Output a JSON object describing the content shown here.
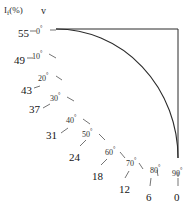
{
  "figure": {
    "value_axis_header": "I",
    "value_axis_header_sub": "f",
    "value_axis_header_unit": "(%)",
    "angle_axis_header": "v",
    "background_color": "#ffffff",
    "line_color": "#2b2b2b"
  },
  "chart_data": {
    "type": "line",
    "title": "",
    "subtitle": "",
    "xlabel": "",
    "ylabel": "",
    "grid": false,
    "legend": null,
    "axis_note": "Quarter-ellipse nomogram: each point on the curve pairs a value on the I_f(%) scale with an angle v in degrees.",
    "curve_shape": "quarter-ellipse",
    "curve_start": [
      56,
      29
    ],
    "curve_end": [
      178,
      158
    ],
    "frame_rect": [
      56,
      29,
      178,
      158
    ],
    "categories": [
      "0",
      "10",
      "20",
      "30",
      "40",
      "50",
      "60",
      "70",
      "80",
      "90"
    ],
    "series": [
      {
        "name": "I_f(%)",
        "values": [
          55,
          49,
          43,
          37,
          31,
          24,
          18,
          12,
          6,
          0
        ]
      }
    ],
    "angle_unit": "degrees",
    "points": [
      {
        "value": "55",
        "angle": "0",
        "value_x": 18,
        "value_y": 28,
        "angle_x": 36,
        "angle_y": 28,
        "tick_x1": 30,
        "tick_y1": 31,
        "tick_x2": 36,
        "tick_y2": 31,
        "tick2_x1": 50,
        "tick2_y1": 30,
        "tick2_x2": 56,
        "tick2_y2": 30
      },
      {
        "value": "49",
        "angle": "10",
        "value_x": 14,
        "value_y": 55,
        "angle_x": 32,
        "angle_y": 53,
        "tick_x1": 27,
        "tick_y1": 58,
        "tick_x2": 33,
        "tick_y2": 58,
        "tick2_x1": 49,
        "tick2_y1": 54,
        "tick2_x2": 56,
        "tick2_y2": 58
      },
      {
        "value": "43",
        "angle": "20",
        "value_x": 21,
        "value_y": 85,
        "angle_x": 38,
        "angle_y": 75,
        "tick_x1": 34,
        "tick_y1": 88,
        "tick_x2": 40,
        "tick_y2": 86,
        "tick2_x1": 56,
        "tick2_y1": 76,
        "tick2_x2": 62,
        "tick2_y2": 80
      },
      {
        "value": "37",
        "angle": "30",
        "value_x": 29,
        "value_y": 104,
        "angle_x": 50,
        "angle_y": 95,
        "tick_x1": 43,
        "tick_y1": 108,
        "tick_x2": 50,
        "tick_y2": 104,
        "tick2_x1": 67,
        "tick2_y1": 97,
        "tick2_x2": 74,
        "tick2_y2": 101
      },
      {
        "value": "31",
        "angle": "40",
        "value_x": 46,
        "value_y": 130,
        "angle_x": 66,
        "angle_y": 117,
        "tick_x1": 61,
        "tick_y1": 133,
        "tick_x2": 68,
        "tick_y2": 128,
        "tick2_x1": 83,
        "tick2_y1": 119,
        "tick2_x2": 90,
        "tick2_y2": 124
      },
      {
        "value": "24",
        "angle": "50",
        "value_x": 69,
        "value_y": 152,
        "angle_x": 82,
        "angle_y": 131,
        "tick_x1": 80,
        "tick_y1": 146,
        "tick_x2": 86,
        "tick_y2": 140,
        "tick2_x1": 99,
        "tick2_y1": 134,
        "tick2_x2": 105,
        "tick2_y2": 140
      },
      {
        "value": "18",
        "angle": "60",
        "value_x": 92,
        "value_y": 171,
        "angle_x": 105,
        "angle_y": 149,
        "tick_x1": 101,
        "tick_y1": 165,
        "tick_x2": 107,
        "tick_y2": 159,
        "tick2_x1": 120,
        "tick2_y1": 152,
        "tick2_x2": 125,
        "tick2_y2": 158
      },
      {
        "value": "12",
        "angle": "70",
        "value_x": 119,
        "value_y": 184,
        "angle_x": 126,
        "angle_y": 160,
        "tick_x1": 125,
        "tick_y1": 178,
        "tick_x2": 129,
        "tick_y2": 171,
        "tick2_x1": 139,
        "tick2_y1": 163,
        "tick2_x2": 143,
        "tick2_y2": 169
      },
      {
        "value": "6",
        "angle": "80",
        "value_x": 146,
        "value_y": 192,
        "angle_x": 150,
        "angle_y": 167,
        "tick_x1": 150,
        "tick_y1": 186,
        "tick_x2": 151,
        "tick_y2": 178,
        "tick2_x1": 157,
        "tick2_y1": 170,
        "tick2_x2": 158,
        "tick2_y2": 176
      },
      {
        "value": "0",
        "angle": "90",
        "value_x": 174,
        "value_y": 192,
        "angle_x": 172,
        "angle_y": 170,
        "tick_x1": 178,
        "tick_y1": 186,
        "tick_x2": 178,
        "tick_y2": 178,
        "tick2_x1": 178,
        "tick2_y1": 172,
        "tick2_x2": 178,
        "tick2_y2": 177
      }
    ]
  }
}
